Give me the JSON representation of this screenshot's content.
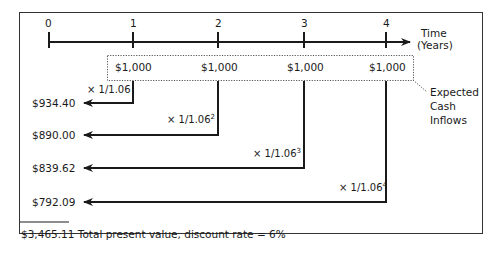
{
  "timeline": {
    "periods": [
      "0",
      "1",
      "2",
      "3",
      "4"
    ],
    "axis_label_line1": "Time",
    "axis_label_line2": "(Years)"
  },
  "cash_inflows": {
    "values": [
      "$1,000",
      "$1,000",
      "$1,000",
      "$1,000"
    ],
    "callout_line1": "Expected",
    "callout_line2": "Cash",
    "callout_line3": "Inflows"
  },
  "discounting": [
    {
      "factor": "× 1/1.06",
      "exponent": "",
      "present_value": "$934.40"
    },
    {
      "factor": "× 1/1.06",
      "exponent": "2",
      "present_value": "$890.00"
    },
    {
      "factor": "× 1/1.06",
      "exponent": "3",
      "present_value": "$839.62"
    },
    {
      "factor": "× 1/1.06",
      "exponent": "4",
      "present_value": "$792.09"
    }
  ],
  "total": {
    "text": "$3,465.11 Total present value, discount rate = 6%"
  },
  "colors": {
    "line": "#1a1a1a",
    "border": "#333333",
    "dotted": "#555555"
  }
}
